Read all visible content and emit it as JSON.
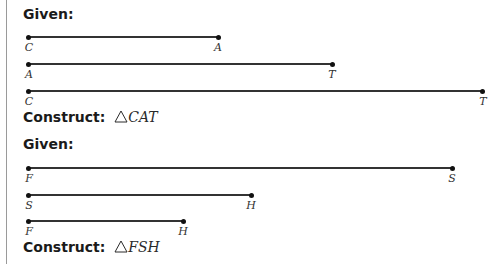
{
  "problems": [
    {
      "given_label": "Given:",
      "construct_label": "Construct:",
      "construct_symbol": "triangle-icon",
      "construct_target": "CAT",
      "segments": [
        {
          "start": "C",
          "end": "A",
          "x1": 28,
          "x2": 218,
          "y": 37
        },
        {
          "start": "A",
          "end": "T",
          "x1": 28,
          "x2": 332,
          "y": 64
        },
        {
          "start": "C",
          "end": "T",
          "x1": 28,
          "x2": 482,
          "y": 91
        }
      ]
    },
    {
      "given_label": "Given:",
      "construct_label": "Construct:",
      "construct_symbol": "triangle-icon",
      "construct_target": "FSH",
      "segments": [
        {
          "start": "F",
          "end": "S",
          "x1": 28,
          "x2": 452,
          "y": 168
        },
        {
          "start": "S",
          "end": "H",
          "x1": 28,
          "x2": 251,
          "y": 195
        },
        {
          "start": "F",
          "end": "H",
          "x1": 28,
          "x2": 183,
          "y": 221
        }
      ]
    }
  ],
  "colors": {
    "line": "#333333",
    "point": "#111111",
    "rule": "#9a9a9a"
  }
}
